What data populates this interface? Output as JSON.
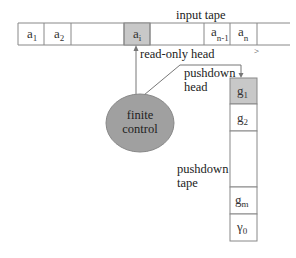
{
  "labels": {
    "input_tape": "input tape",
    "read_only_head": "read-only head",
    "pushdown_head_line1": "pushdown",
    "pushdown_head_line2": "head",
    "finite_control_line1": "finite",
    "finite_control_line2": "control",
    "pushdown_tape_line1": "pushdown",
    "pushdown_tape_line2": "tape",
    "tape_direction": ">"
  },
  "input_tape": {
    "cells": [
      {
        "base": "a",
        "sub": "1",
        "shaded": false
      },
      {
        "base": "a",
        "sub": "2",
        "shaded": false
      },
      {
        "base": "",
        "sub": "",
        "shaded": false
      },
      {
        "base": "a",
        "sub": "i",
        "shaded": true
      },
      {
        "base": "",
        "sub": "",
        "shaded": false
      },
      {
        "base": "a",
        "sub": "n-1",
        "shaded": false
      },
      {
        "base": "a",
        "sub": "n",
        "shaded": false
      },
      {
        "base": "",
        "sub": "",
        "shaded": false
      }
    ]
  },
  "pushdown_tape": {
    "cells": [
      {
        "base": "g",
        "sub": "1",
        "shaded": true
      },
      {
        "base": "g",
        "sub": "2",
        "shaded": false
      },
      {
        "base": "",
        "sub": "",
        "shaded": false
      },
      {
        "base": "g",
        "sub": "m",
        "shaded": false
      },
      {
        "base": "γ",
        "sub": "0",
        "shaded": false
      }
    ]
  },
  "colors": {
    "shaded_cell": "#c8c8c8",
    "ellipse_fill": "#a0a0a0",
    "line": "#888888"
  }
}
